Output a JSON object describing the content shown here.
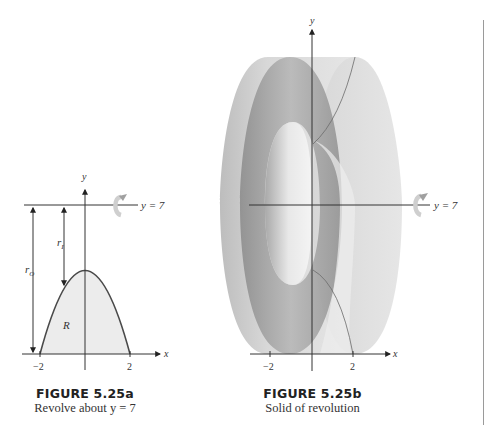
{
  "figure_a": {
    "title": "FIGURE 5.25a",
    "caption": "Revolve about y = 7",
    "axis_x_label": "x",
    "axis_y_label": "y",
    "line_label": "y = 7",
    "tick_left": "−2",
    "tick_right": "2",
    "region_label": "R",
    "r_inner_label": "r",
    "r_inner_sub": "I",
    "r_outer_label": "r",
    "r_outer_sub": "O",
    "rotation_icon": "rotate-arrow-icon"
  },
  "figure_b": {
    "title": "FIGURE 5.25b",
    "caption": "Solid of revolution",
    "axis_x_label": "x",
    "axis_y_label": "y",
    "line_label": "y = 7",
    "tick_left": "−2",
    "tick_right": "2",
    "rotation_icon": "rotate-arrow-icon"
  },
  "colors": {
    "axis": "#333333",
    "region_fill": "#ececec",
    "curve": "#4a4a4a",
    "solid_light": "#d9d9d9",
    "solid_dark": "#8c8c8c",
    "rule": "#9a9a9a"
  }
}
